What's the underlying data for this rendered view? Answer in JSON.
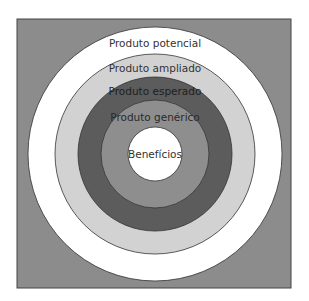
{
  "diagram": {
    "background_color": "#8c8c8c",
    "rings": [
      {
        "label": "Produto potencial",
        "radius": 127,
        "fill": "#ffffff",
        "text_color": "#333333",
        "label_y": 47
      },
      {
        "label": "Produto ampliado",
        "radius": 100,
        "fill": "#d2d2d2",
        "text_color": "#333333",
        "label_y": 72
      },
      {
        "label": "Produto esperado",
        "radius": 77,
        "fill": "#5c5c5c",
        "text_color": "#1e1e1e",
        "label_y": 95
      },
      {
        "label": "Produto genérico",
        "radius": 54,
        "fill": "#8e8e8e",
        "text_color": "#2a2a2a",
        "label_y": 121
      },
      {
        "label": "Benefícios",
        "radius": 27,
        "fill": "#ffffff",
        "text_color": "#333333",
        "label_y": 158
      }
    ]
  }
}
